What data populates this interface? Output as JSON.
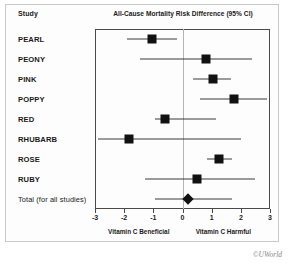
{
  "figure": {
    "column_header": "Study",
    "watermark": "©UWorld"
  },
  "chart_data": {
    "type": "forest",
    "title": "All-Cause Mortality Risk Difference (95% CI)",
    "xlabel": "",
    "ylabel": "Study",
    "xlim": [
      -3,
      3
    ],
    "xticks": [
      -3,
      -2,
      -1,
      0,
      1,
      2,
      3
    ],
    "xtick_labels": [
      "-3",
      "-2",
      "-1",
      "0",
      "1",
      "2",
      "3"
    ],
    "grid": false,
    "null_value": 0,
    "left_direction_label": "Vitamin C Beneficial",
    "right_direction_label": "Vitamin C Harmful",
    "left_direction_x": -1.5,
    "right_direction_x": 1.4,
    "categories": [
      "PEARL",
      "PEONY",
      "PINK",
      "POPPY",
      "RED",
      "RHUBARB",
      "ROSE",
      "RUBY",
      "Total (for all studies)"
    ],
    "estimates": [
      -1.05,
      0.8,
      1.05,
      1.75,
      -0.6,
      -1.85,
      1.25,
      0.5,
      0.2
    ],
    "ci_low": [
      -1.9,
      -1.45,
      0.35,
      0.6,
      -0.95,
      -2.9,
      0.85,
      -1.3,
      -0.95
    ],
    "ci_high": [
      -0.2,
      2.4,
      1.65,
      2.9,
      1.15,
      2.0,
      1.7,
      2.5,
      1.7
    ],
    "marker_shapes": [
      "square",
      "square",
      "square",
      "square",
      "square",
      "square",
      "square",
      "square",
      "diamond"
    ],
    "rows": [
      {
        "label": "PEARL",
        "estimate": -1.05,
        "ci_low": -1.9,
        "ci_high": -0.2,
        "shape": "square"
      },
      {
        "label": "PEONY",
        "estimate": 0.8,
        "ci_low": -1.45,
        "ci_high": 2.4,
        "shape": "square"
      },
      {
        "label": "PINK",
        "estimate": 1.05,
        "ci_low": 0.35,
        "ci_high": 1.65,
        "shape": "square"
      },
      {
        "label": "POPPY",
        "estimate": 1.75,
        "ci_low": 0.6,
        "ci_high": 2.9,
        "shape": "square"
      },
      {
        "label": "RED",
        "estimate": -0.6,
        "ci_low": -0.95,
        "ci_high": 1.15,
        "shape": "square"
      },
      {
        "label": "RHUBARB",
        "estimate": -1.85,
        "ci_low": -2.9,
        "ci_high": 2.0,
        "shape": "square"
      },
      {
        "label": "ROSE",
        "estimate": 1.25,
        "ci_low": 0.85,
        "ci_high": 1.7,
        "shape": "square"
      },
      {
        "label": "RUBY",
        "estimate": 0.5,
        "ci_low": -1.3,
        "ci_high": 2.5,
        "shape": "square"
      },
      {
        "label": "Total (for all studies)",
        "estimate": 0.2,
        "ci_low": -0.95,
        "ci_high": 1.7,
        "shape": "diamond"
      }
    ]
  }
}
